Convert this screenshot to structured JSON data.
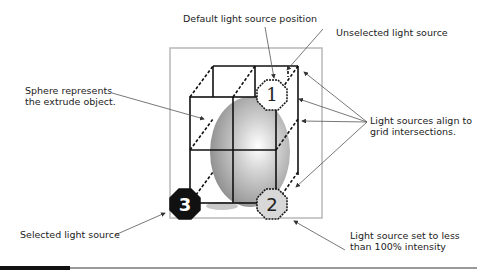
{
  "callouts": {
    "default_position": "Default light source position",
    "unselected": "Unselected light source",
    "sphere": [
      "Sphere represents",
      "the extrude object."
    ],
    "align": [
      "Light sources align to",
      "grid intersections."
    ],
    "selected": "Selected light source",
    "intensity": [
      "Light source set to less",
      "than 100% intensity"
    ]
  },
  "light_sources": [
    {
      "number": "1",
      "state": "default",
      "fill": "#ffffff",
      "text_color": "#222222"
    },
    {
      "number": "2",
      "state": "reduced-intensity",
      "fill": "#d8d8d8",
      "text_color": "#222222"
    },
    {
      "number": "3",
      "state": "selected",
      "fill": "#111111",
      "text_color": "#ffffff"
    }
  ],
  "colors": {
    "frame": "#b8b8b8",
    "grid": "#111111",
    "arrow": "#555555"
  }
}
